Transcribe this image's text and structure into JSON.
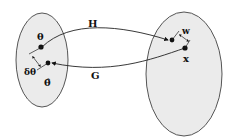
{
  "diagram": {
    "left_set": {
      "fill": "#ebebeb",
      "stroke": "#555555"
    },
    "right_set": {
      "fill": "#ebebeb",
      "stroke": "#555555"
    },
    "labels": {
      "theta": "θ",
      "theta_hat": "θ̂",
      "delta_theta": "δθ",
      "H": "H",
      "G": "G",
      "w": "w",
      "x": "x"
    }
  }
}
